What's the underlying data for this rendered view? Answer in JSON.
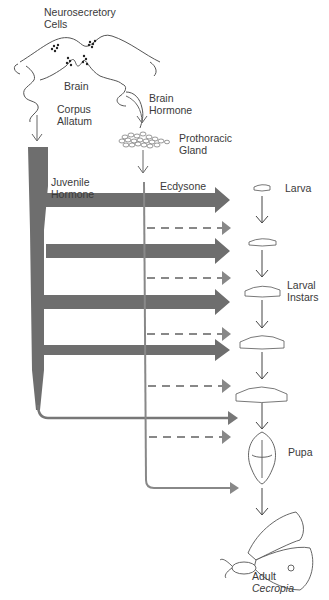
{
  "diagram": {
    "labels": {
      "neurosecretory": [
        "Neurosecretory",
        "Cells"
      ],
      "brain": "Brain",
      "corpus_allatum": [
        "Corpus",
        "Allatum"
      ],
      "brain_hormone": [
        "Brain",
        "Hormone"
      ],
      "prothoracic_gland": [
        "Prothoracic",
        "Gland"
      ],
      "juvenile_hormone": [
        "Juvenile",
        "Hormone"
      ],
      "ecdysone": "Ecdysone",
      "larva": "Larva",
      "larval_instars": [
        "Larval",
        "Instars"
      ],
      "pupa": "Pupa",
      "adult": "Adult",
      "species": "Cecropia"
    },
    "stages": [
      "Larva",
      "Larval instar 1",
      "Larval instar 2",
      "Larval instar 3",
      "Larval instar 4",
      "Pupa",
      "Adult Cecropia"
    ],
    "colors": {
      "juvenile_hormone_arrow": "#6e6e6e",
      "ecdysone_arrow": "#8a8a8a",
      "outline": "#555555",
      "background": "#ffffff"
    }
  }
}
